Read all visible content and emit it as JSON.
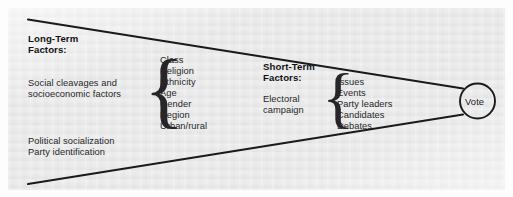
{
  "figure": {
    "type": "funnel-of-causality-diagram",
    "background_color": "#e9e9e9",
    "line_color": "#1a1a1a",
    "text_color": "#26262a"
  },
  "long_term": {
    "heading_line1": "Long-Term",
    "heading_line2": "Factors:",
    "description_line1": "Social cleavages and",
    "description_line2": "socioeconomic factors",
    "items": [
      "Class",
      "Religion",
      "Ethnicity",
      "Age",
      "Gender",
      "Region",
      "Urban/rural"
    ],
    "extra_line1": "Political socialization",
    "extra_line2": "Party identification",
    "brace": "{"
  },
  "short_term": {
    "heading_line1": "Short-Term",
    "heading_line2": "Factors:",
    "description_line1": "Electoral",
    "description_line2": "campaign",
    "items": [
      "Issues",
      "Events",
      "Party leaders",
      "Candidates",
      "Debates"
    ],
    "brace": "{"
  },
  "outcome": {
    "label": "Vote"
  }
}
